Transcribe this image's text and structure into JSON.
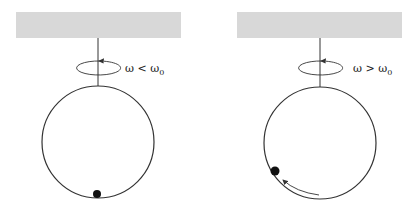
{
  "panels": [
    {
      "id": "left",
      "label": {
        "omega": "ω",
        "relation": "<",
        "omega0": "ω",
        "sub": "0"
      },
      "ceiling": {
        "x": 16,
        "y": 12,
        "w": 165,
        "h": 26,
        "color": "#d8d8d8"
      },
      "rod_x": 98,
      "hoop": {
        "cx": 98,
        "cy": 142,
        "r": 56
      },
      "bead": {
        "cx": 97,
        "cy": 194,
        "r": 4
      },
      "rotation_ellipse": {
        "cx": 97,
        "cy": 68,
        "rx": 22,
        "ry": 7
      },
      "has_motion_arrow": false
    },
    {
      "id": "right",
      "label": {
        "omega": "ω",
        "relation": ">",
        "omega0": "ω",
        "sub": "0"
      },
      "ceiling": {
        "x": 237,
        "y": 12,
        "w": 165,
        "h": 26,
        "color": "#d8d8d8"
      },
      "rod_x": 320,
      "hoop": {
        "cx": 320,
        "cy": 143,
        "r": 56
      },
      "bead": {
        "cx": 275,
        "cy": 171,
        "r": 4.5
      },
      "rotation_ellipse": {
        "cx": 320,
        "cy": 68,
        "rx": 22,
        "ry": 7
      },
      "has_motion_arrow": true
    }
  ],
  "colors": {
    "line": "#333333",
    "bead": "#111111",
    "ceiling": "#d8d8d8"
  }
}
